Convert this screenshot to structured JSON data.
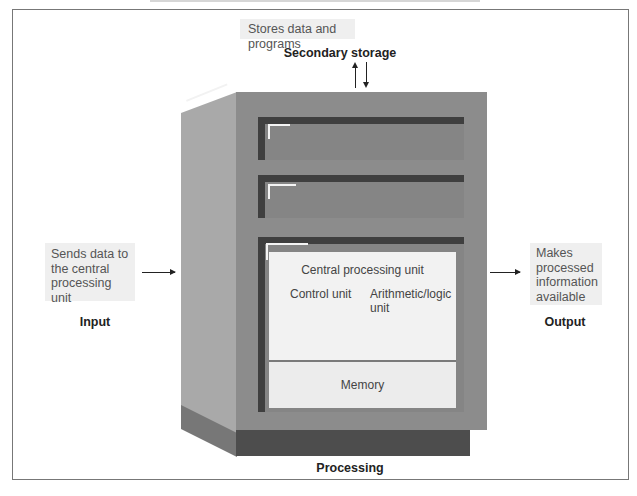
{
  "secondary_storage": {
    "description": "Stores data and programs",
    "label": "Secondary storage"
  },
  "input": {
    "description": "Sends data to the central processing unit",
    "description_lines": [
      "Sends data to",
      "the central",
      "processing unit"
    ],
    "label": "Input"
  },
  "output": {
    "description": "Makes processed information available",
    "description_lines": [
      "Makes",
      "processed",
      "information",
      "available"
    ],
    "label": "Output"
  },
  "processing": {
    "label": "Processing",
    "cpu": {
      "title": "Central processing unit",
      "control_unit": "Control unit",
      "alu_lines": [
        "Arithmetic/logic",
        "unit"
      ]
    },
    "memory": "Memory"
  },
  "colors": {
    "cabinet_front": "#8c8c8c",
    "cabinet_side": "#a9a9a9",
    "cabinet_base": "#4d4d4d",
    "drawer_shadow": "#3f3f3f",
    "note_background": "#efefef",
    "cpu_panel": "#f2f2f2"
  }
}
